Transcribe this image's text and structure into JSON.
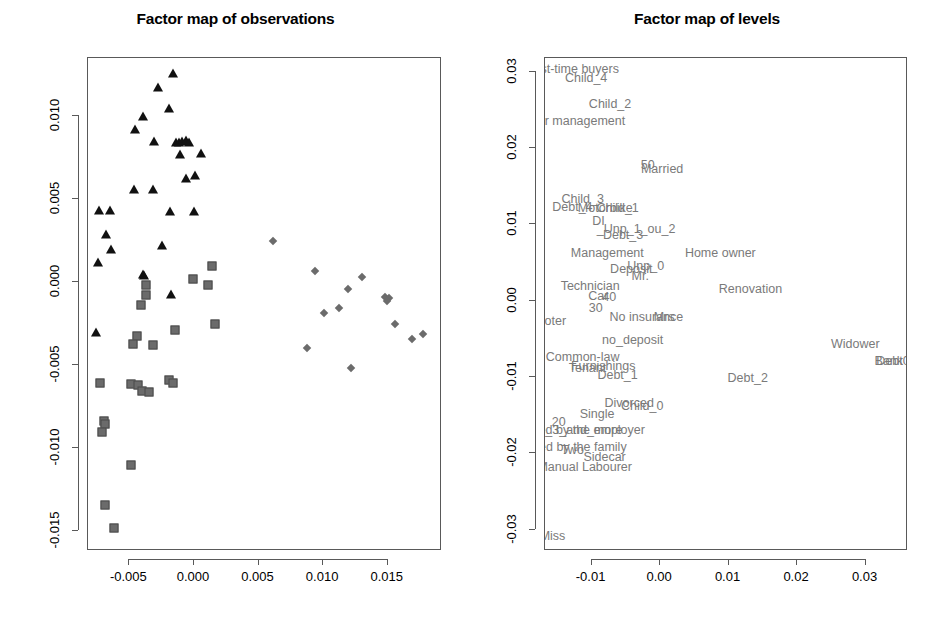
{
  "left_panel": {
    "title": "Factor map of observations"
  },
  "right_panel": {
    "title": "Factor map of levels"
  },
  "chart_data": [
    {
      "type": "scatter",
      "title": "Factor map of observations",
      "xlabel": "",
      "ylabel": "",
      "xlim": [
        -0.0082,
        0.0192
      ],
      "ylim": [
        -0.0162,
        0.0135
      ],
      "xticks": [
        -0.005,
        0.0,
        0.005,
        0.01,
        0.015
      ],
      "xticklabels": [
        "-0.005",
        "0.000",
        "0.005",
        "0.010",
        "0.015"
      ],
      "yticks": [
        -0.015,
        -0.01,
        -0.005,
        0.0,
        0.005,
        0.01
      ],
      "yticklabels": [
        "-0.015",
        "-0.010",
        "-0.005",
        "0.000",
        "0.005",
        "0.010"
      ],
      "grid": false,
      "legend": "none",
      "series": [
        {
          "name": "triangles",
          "marker": "triangle",
          "color": "#111111",
          "points": [
            [
              -0.00165,
              0.01255
            ],
            [
              -0.00275,
              0.0117
            ],
            [
              -0.00195,
              0.0104
            ],
            [
              -0.00395,
              0.00995
            ],
            [
              -0.00455,
              0.00915
            ],
            [
              -0.0031,
              0.00845
            ],
            [
              -0.0014,
              0.00835
            ],
            [
              -0.00115,
              0.0084
            ],
            [
              -0.0009,
              0.00845
            ],
            [
              -0.00065,
              0.0085
            ],
            [
              -0.0004,
              0.00838
            ],
            [
              -0.00105,
              0.00765
            ],
            [
              0.00055,
              0.0077
            ],
            [
              -0.0006,
              0.0062
            ],
            [
              5e-05,
              0.0064
            ],
            [
              -0.00465,
              0.00555
            ],
            [
              -0.00315,
              0.00555
            ],
            [
              -0.00735,
              0.0043
            ],
            [
              -0.0065,
              0.0043
            ],
            [
              -0.00185,
              0.00425
            ],
            [
              0.0,
              0.00425
            ],
            [
              -0.0068,
              0.00285
            ],
            [
              -0.0064,
              0.00195
            ],
            [
              -0.00245,
              0.00215
            ],
            [
              -0.0074,
              0.00115
            ],
            [
              -0.0039,
              0.00035
            ],
            [
              -0.0018,
              -0.00075
            ],
            [
              -0.00755,
              -0.00305
            ],
            [
              -0.00395,
              0.0004
            ]
          ]
        },
        {
          "name": "squares",
          "marker": "square",
          "color": "#6b6b6b",
          "points": [
            [
              0.0014,
              0.00095
            ],
            [
              -5e-05,
              0.0002
            ],
            [
              0.0011,
              -0.0002
            ],
            [
              -0.0037,
              -0.0002
            ],
            [
              -0.0037,
              -0.00075
            ],
            [
              -0.0041,
              -0.00135
            ],
            [
              0.0016,
              -0.00255
            ],
            [
              -0.00145,
              -0.0029
            ],
            [
              -0.0044,
              -0.00325
            ],
            [
              -0.00475,
              -0.00375
            ],
            [
              -0.00315,
              -0.0038
            ],
            [
              -0.0073,
              -0.0061
            ],
            [
              -0.0049,
              -0.00615
            ],
            [
              -0.0043,
              -0.0062
            ],
            [
              -0.0019,
              -0.0059
            ],
            [
              -0.0016,
              -0.00605
            ],
            [
              -0.004,
              -0.00655
            ],
            [
              -0.00345,
              -0.00665
            ],
            [
              -0.007,
              -0.00835
            ],
            [
              -0.0069,
              -0.00855
            ],
            [
              -0.00715,
              -0.00905
            ],
            [
              -0.0049,
              -0.011
            ],
            [
              -0.0069,
              -0.01345
            ],
            [
              -0.0062,
              -0.0148
            ]
          ]
        },
        {
          "name": "diamonds",
          "marker": "diamond",
          "color": "#6b6b6b",
          "points": [
            [
              0.0061,
              0.0025
            ],
            [
              0.0094,
              0.00065
            ],
            [
              0.013,
              0.0003
            ],
            [
              0.0119,
              -0.0004
            ],
            [
              0.01475,
              -0.0009
            ],
            [
              0.0151,
              -0.00095
            ],
            [
              0.01495,
              -0.00115
            ],
            [
              0.0112,
              -0.00155
            ],
            [
              0.0101,
              -0.00185
            ],
            [
              0.0156,
              -0.00255
            ],
            [
              0.0177,
              -0.0031
            ],
            [
              0.0169,
              -0.00345
            ],
            [
              0.00875,
              -0.004
            ],
            [
              0.01215,
              -0.0052
            ]
          ]
        }
      ]
    },
    {
      "type": "scatter",
      "title": "Factor map of levels",
      "xlabel": "",
      "ylabel": "",
      "xlim": [
        -0.0168,
        0.0362
      ],
      "ylim": [
        -0.0328,
        0.0318
      ],
      "xticks": [
        -0.01,
        0.0,
        0.01,
        0.02,
        0.03
      ],
      "xticklabels": [
        "-0.01",
        "0.00",
        "0.01",
        "0.02",
        "0.03"
      ],
      "yticks": [
        -0.03,
        -0.02,
        -0.01,
        0.0,
        0.01,
        0.02,
        0.03
      ],
      "yticklabels": [
        "-0.03",
        "-0.02",
        "-0.01",
        "0.00",
        "0.01",
        "0.02",
        "0.03"
      ],
      "grid": false,
      "legend": "none",
      "labels": [
        {
          "text": "First-time buyers",
          "x": -0.0128,
          "y": 0.0303
        },
        {
          "text": "Child_4",
          "x": -0.0108,
          "y": 0.0292
        },
        {
          "text": "Child_2",
          "x": -0.0073,
          "y": 0.0258
        },
        {
          "text": "Senior management",
          "x": -0.0133,
          "y": 0.0236
        },
        {
          "text": "50",
          "x": -0.0018,
          "y": 0.0178
        },
        {
          "text": "Married",
          "x": 0.0003,
          "y": 0.0172
        },
        {
          "text": "Child_3",
          "x": -0.0113,
          "y": 0.0133
        },
        {
          "text": "Debt_4",
          "x": -0.0128,
          "y": 0.0123
        },
        {
          "text": "Motorbike",
          "x": -0.008,
          "y": 0.0122
        },
        {
          "text": "Child_1",
          "x": -0.0062,
          "y": 0.0121
        },
        {
          "text": "DI",
          "x": -0.009,
          "y": 0.0105
        },
        {
          "text": "_Unp_1_ou_2",
          "x": -0.0035,
          "y": 0.0094
        },
        {
          "text": "Debt_3",
          "x": -0.0054,
          "y": 0.0086
        },
        {
          "text": "Management",
          "x": -0.0077,
          "y": 0.0062
        },
        {
          "text": "Home owner",
          "x": 0.0088,
          "y": 0.0062
        },
        {
          "text": "Deposit",
          "x": -0.0042,
          "y": 0.0041
        },
        {
          "text": "Unp_0",
          "x": -0.0021,
          "y": 0.0045
        },
        {
          "text": "Mr.",
          "x": -0.0029,
          "y": 0.0033
        },
        {
          "text": "Technician",
          "x": -0.0102,
          "y": 0.0019
        },
        {
          "text": "Renovation",
          "x": 0.0132,
          "y": 0.0015
        },
        {
          "text": "Car",
          "x": -0.009,
          "y": 0.0006
        },
        {
          "text": "40",
          "x": -0.0074,
          "y": 0.0005
        },
        {
          "text": "30",
          "x": -0.0094,
          "y": -0.0009
        },
        {
          "text": "No insurance",
          "x": -0.002,
          "y": -0.0021
        },
        {
          "text": "Mrs",
          "x": 0.0006,
          "y": -0.0021
        },
        {
          "text": "ooter",
          "x": -0.0158,
          "y": -0.0026
        },
        {
          "text": "no_deposit",
          "x": -0.004,
          "y": -0.0052
        },
        {
          "text": "Widower",
          "x": 0.0285,
          "y": -0.0057
        },
        {
          "text": "Common-law",
          "x": -0.0113,
          "y": -0.0074
        },
        {
          "text": "Bank",
          "x": 0.0334,
          "y": -0.0079
        },
        {
          "text": "Debt0",
          "x": 0.034,
          "y": -0.0079
        },
        {
          "text": "Furnishings",
          "x": -0.0083,
          "y": -0.0085
        },
        {
          "text": "Tenant",
          "x": -0.0106,
          "y": -0.0088
        },
        {
          "text": "Debt_1",
          "x": -0.0062,
          "y": -0.0098
        },
        {
          "text": "Debt_2",
          "x": 0.0128,
          "y": -0.0101
        },
        {
          "text": "Divorced",
          "x": -0.0045,
          "y": -0.0134
        },
        {
          "text": "Child_0",
          "x": -0.0026,
          "y": -0.0138
        },
        {
          "text": "Single",
          "x": -0.0092,
          "y": -0.0148
        },
        {
          "text": "20",
          "x": -0.0148,
          "y": -0.0159
        },
        {
          "text": "Unp_3_and_more",
          "x": -0.0128,
          "y": -0.0169
        },
        {
          "text": "Lodged by the employer",
          "x": -0.012,
          "y": -0.017
        },
        {
          "text": "Lodged by the family",
          "x": -0.0133,
          "y": -0.0192
        },
        {
          "text": "Two",
          "x": -0.0128,
          "y": -0.0196
        },
        {
          "text": "Sidecar",
          "x": -0.0081,
          "y": -0.0205
        },
        {
          "text": "Manual Labourer",
          "x": -0.011,
          "y": -0.0218
        },
        {
          "text": "Miss",
          "x": -0.0157,
          "y": -0.0308
        }
      ]
    }
  ]
}
